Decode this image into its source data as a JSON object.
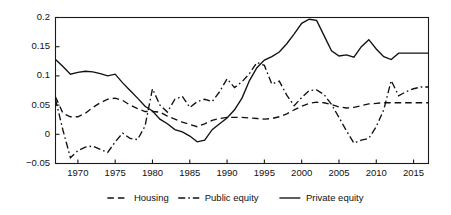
{
  "chart_data": {
    "type": "line",
    "title": "",
    "subtitle": "",
    "xlabel": "",
    "ylabel": "",
    "xlim": [
      1967,
      2017
    ],
    "ylim": [
      -0.05,
      0.2
    ],
    "grid": false,
    "legend_position": "bottom",
    "x_ticks": [
      1970,
      1975,
      1980,
      1985,
      1990,
      1995,
      2000,
      2005,
      2010,
      2015
    ],
    "x_tick_labels": [
      "1970",
      "1975",
      "1980",
      "1985",
      "1990",
      "1995",
      "2000",
      "2005",
      "2010",
      "2015"
    ],
    "y_ticks": [
      -0.05,
      0,
      0.05,
      0.1,
      0.15,
      0.2
    ],
    "y_tick_labels": [
      "−0.05",
      "0",
      "0.05",
      "0.1",
      "0.15",
      "0.2"
    ],
    "x": [
      1967,
      1968,
      1969,
      1970,
      1971,
      1972,
      1973,
      1974,
      1975,
      1976,
      1977,
      1978,
      1979,
      1980,
      1981,
      1982,
      1983,
      1984,
      1985,
      1986,
      1987,
      1988,
      1989,
      1990,
      1991,
      1992,
      1993,
      1994,
      1995,
      1996,
      1997,
      1998,
      1999,
      2000,
      2001,
      2002,
      2003,
      2004,
      2005,
      2006,
      2007,
      2008,
      2009,
      2010,
      2011,
      2012,
      2013,
      2014,
      2015,
      2016,
      2017
    ],
    "series": [
      {
        "name": "Housing",
        "style": "dashed",
        "color": "#111111",
        "values": [
          0.064,
          0.036,
          0.03,
          0.03,
          0.036,
          0.046,
          0.054,
          0.06,
          0.062,
          0.058,
          0.05,
          0.044,
          0.039,
          0.039,
          0.038,
          0.031,
          0.026,
          0.021,
          0.017,
          0.013,
          0.018,
          0.024,
          0.027,
          0.029,
          0.029,
          0.029,
          0.028,
          0.027,
          0.026,
          0.027,
          0.03,
          0.035,
          0.042,
          0.048,
          0.053,
          0.055,
          0.054,
          0.051,
          0.047,
          0.045,
          0.046,
          0.049,
          0.052,
          0.053,
          0.054,
          0.054,
          0.054,
          0.054,
          0.054,
          0.054,
          0.054
        ]
      },
      {
        "name": "Public equity",
        "style": "dash-dot",
        "color": "#111111",
        "values": [
          0.06,
          0.007,
          -0.04,
          -0.028,
          -0.022,
          -0.02,
          -0.026,
          -0.031,
          -0.013,
          0.002,
          -0.007,
          -0.009,
          0.014,
          0.078,
          0.05,
          0.038,
          0.06,
          0.065,
          0.046,
          0.056,
          0.06,
          0.056,
          0.073,
          0.095,
          0.08,
          0.09,
          0.104,
          0.123,
          0.118,
          0.086,
          0.091,
          0.067,
          0.049,
          0.063,
          0.075,
          0.076,
          0.068,
          0.051,
          0.029,
          0.006,
          -0.015,
          -0.01,
          -0.007,
          0.013,
          0.042,
          0.092,
          0.066,
          0.073,
          0.078,
          0.081,
          0.081
        ]
      },
      {
        "name": "Private equity",
        "style": "solid",
        "color": "#111111",
        "values": [
          0.128,
          0.116,
          0.103,
          0.106,
          0.108,
          0.107,
          0.104,
          0.1,
          0.103,
          0.088,
          0.075,
          0.062,
          0.048,
          0.04,
          0.026,
          0.018,
          0.008,
          0.004,
          -0.003,
          -0.013,
          -0.01,
          0.008,
          0.018,
          0.028,
          0.042,
          0.062,
          0.092,
          0.114,
          0.127,
          0.133,
          0.141,
          0.155,
          0.172,
          0.19,
          0.197,
          0.195,
          0.169,
          0.143,
          0.134,
          0.136,
          0.132,
          0.15,
          0.162,
          0.146,
          0.133,
          0.128,
          0.139,
          0.139,
          0.139,
          0.139,
          0.139
        ]
      }
    ],
    "legend": [
      {
        "label": "Housing",
        "style": "dashed"
      },
      {
        "label": "Public equity",
        "style": "dash-dot"
      },
      {
        "label": "Private equity",
        "style": "solid"
      }
    ]
  }
}
